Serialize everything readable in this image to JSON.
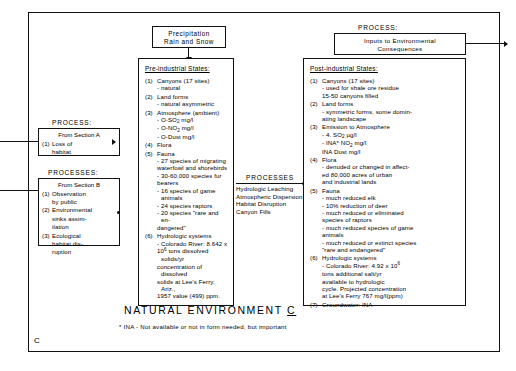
{
  "figure": {
    "title": "NATURAL  ENVIRONMENT ",
    "title_suffix": "C",
    "corner_label": "C",
    "footnote": "* INA - Not available or not in form needed, but important"
  },
  "precipitation_box": {
    "line1": "Precipitation",
    "line2": "Rain  and  Snow"
  },
  "process_top_right": {
    "caption": "PROCESS:",
    "line1": "Inputs  to  Environmental",
    "line2": "Consequences"
  },
  "process_a": {
    "caption": "PROCESS:",
    "header": "From Section A",
    "items": [
      {
        "num": "(1)",
        "text": "Loss of"
      },
      {
        "num": "",
        "text": "habitat"
      }
    ]
  },
  "process_b": {
    "caption": "PROCESSES:",
    "header": "From Section B",
    "items": [
      {
        "num": "(1)",
        "text": "Observation"
      },
      {
        "num": "",
        "text": "by public"
      },
      {
        "num": "(2)",
        "text": "Environmental"
      },
      {
        "num": "",
        "text": "sinks assim-"
      },
      {
        "num": "",
        "text": "ilation"
      },
      {
        "num": "(3)",
        "text": "Ecological"
      },
      {
        "num": "",
        "text": "habitat dis-"
      },
      {
        "num": "",
        "text": "ruption"
      }
    ]
  },
  "process_middle": {
    "caption": "PROCESSES",
    "lines": [
      "Hydrologic  Leaching",
      "Atmospheric  Dispersion",
      "Habitat Disruption",
      "Canyon Fills"
    ]
  },
  "pre_industrial": {
    "title": "Pre-industrial States:",
    "items": [
      {
        "num": "(1)",
        "text": "Canyons  (17 sites)",
        "subs": [
          "- natural"
        ]
      },
      {
        "num": "(2)",
        "text": "Land forms",
        "subs": [
          "- natural  asymmetric"
        ]
      },
      {
        "num": "(3)",
        "text": "Atmosphere (ambient)",
        "subs": [
          "- O-SO2 mg/l",
          "- O-NO2 mg/l",
          "- O-Dust mg/l"
        ]
      },
      {
        "num": "(4)",
        "text": "Flora",
        "subs": []
      },
      {
        "num": "(5)",
        "text": "Fauna",
        "subs": [
          "- 27 species of migrating",
          "waterfowl and shorebirds",
          "- 30-60,000 species fur",
          "bearers",
          "- 16 species of game animals",
          "- 24 species raptors",
          "- 20 species \"rare  and en-",
          "dangered\""
        ]
      },
      {
        "num": "(6)",
        "text": "Hydrologic systems",
        "subs": [
          "- Colorado River: 8.642 x",
          "10^6 tons dissolved solids/yr",
          "concentration of dissolved",
          "solids at Lee's Ferry, Ariz.,",
          "1957 value (499) ppm."
        ]
      }
    ]
  },
  "post_industrial": {
    "title": "Post-industrial States:",
    "items": [
      {
        "num": "(1)",
        "text": "Canyons  (17 sites)",
        "subs": [
          "- used for shale ore residue",
          "15-50 canyons filled"
        ]
      },
      {
        "num": "(2)",
        "text": "Land forms",
        "subs": [
          "- symmetric forms, some domin-",
          "ating landscape"
        ]
      },
      {
        "num": "(3)",
        "text": "Emission  to  Atmosphere",
        "subs": [
          "- 4. SO2  µg/l",
          "- INA*  NO2  mg/l",
          "INA Dust mg/l"
        ]
      },
      {
        "num": "(4)",
        "text": "Flora",
        "subs": [
          "- denuded or changed in affect-",
          "ed 80,000 acres of urban",
          "and  industrial  lands"
        ]
      },
      {
        "num": "(5)",
        "text": "Fauna",
        "subs": [
          "- much reduced elk",
          "- 10%  reduction of deer",
          "- much reduced or eliminated",
          "species of raptors",
          "- much reduced species of game",
          "animals",
          "- much reduced or extinct species",
          "\"rare and endangered\""
        ]
      },
      {
        "num": "(6)",
        "text": "Hydrologic  systems",
        "subs": [
          "- Colorado River: 4.92 x 10^6",
          "tons additional salt/yr",
          "available to hydrologic",
          "cycle. Projected concentration",
          "at Lee's Ferry 767 mg/l(ppm)"
        ]
      },
      {
        "num": "(7)",
        "text": "Groundwater: INA",
        "subs": []
      }
    ]
  }
}
